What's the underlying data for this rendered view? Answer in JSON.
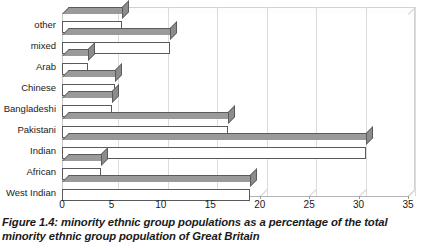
{
  "caption": "Figure 1.4: minority ethnic group populations as a percentage of the total minority ethnic group population of Great Britain",
  "chart_data": {
    "type": "bar",
    "orientation": "horizontal",
    "style": "3d",
    "title": "",
    "subtitle": "",
    "xlabel": "",
    "ylabel": "",
    "xlim": [
      0,
      35
    ],
    "xticks": [
      0,
      5,
      10,
      15,
      20,
      25,
      30,
      35
    ],
    "tick_labels": [
      "0",
      "5",
      "10",
      "15",
      "20",
      "25",
      "30",
      "35"
    ],
    "grid": "vertical",
    "legend": "none",
    "categories": [
      "other",
      "mixed",
      "Arab",
      "Chinese",
      "Bangladeshi",
      "Pakistani",
      "Indian",
      "African",
      "West Indian"
    ],
    "values": [
      6.1,
      10.9,
      2.6,
      5.4,
      5.1,
      16.8,
      30.8,
      3.9,
      19.0
    ],
    "bars": [
      {
        "category": "other",
        "value": 6.1
      },
      {
        "category": "mixed",
        "value": 10.9
      },
      {
        "category": "Arab",
        "value": 2.6
      },
      {
        "category": "Chinese",
        "value": 5.4
      },
      {
        "category": "Bangladeshi",
        "value": 5.1
      },
      {
        "category": "Pakistani",
        "value": 16.8
      },
      {
        "category": "Indian",
        "value": 30.8
      },
      {
        "category": "African",
        "value": 3.9
      },
      {
        "category": "West Indian",
        "value": 19.0
      }
    ],
    "colors": {
      "bar_face": "#ffffff",
      "bar_top": "#9a9a9a",
      "bar_side": "#8c8c8c",
      "bar_outline": "#5a5a5a",
      "gridline": "#dcdcdc",
      "axis": "#b4b4b4",
      "background": "#ffffff",
      "text": "#1a1a1a"
    }
  }
}
